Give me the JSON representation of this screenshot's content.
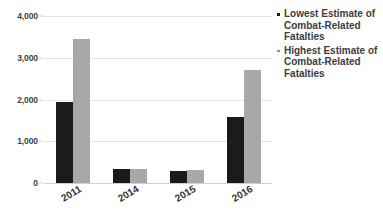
{
  "chart_data": {
    "type": "bar",
    "title": "",
    "subtitle": "",
    "xlabel": "",
    "ylabel": "",
    "categories": [
      "2011",
      "2014",
      "2015",
      "2016"
    ],
    "series": [
      {
        "name": "Lowest Estimate of Combat-Related Fatalties",
        "color": "#1b1b1b",
        "values": [
          1940,
          330,
          280,
          1580
        ]
      },
      {
        "name": "Highest Estimate of Combat-Related Fatalties",
        "color": "#a8a8a8",
        "values": [
          3450,
          330,
          320,
          2700
        ]
      }
    ],
    "ylim": [
      0,
      4000
    ],
    "yticks": [
      "0",
      "1,000",
      "2,000",
      "3,000",
      "4,000"
    ],
    "ytick_values": [
      0,
      1000,
      2000,
      3000,
      4000
    ],
    "grid": true,
    "legend_position": "right",
    "annotations": []
  },
  "legend": {
    "entries": [
      {
        "marker": "low-series-marker",
        "label": "Lowest Estimate of Combat-Related Fatalties"
      },
      {
        "marker": "high-series-marker",
        "label": "Highest Estimate of Combat-Related Fatalties"
      }
    ]
  },
  "axis": {
    "y_tick_labels": [
      "4,000",
      "3,000",
      "2,000",
      "1,000",
      "0"
    ],
    "x_tick_labels": [
      "2011",
      "2014",
      "2015",
      "2016"
    ]
  },
  "colors": {
    "low_series": "#1b1b1b",
    "high_series": "#a8a8a8",
    "gridline": "#e3e3e3",
    "baseline": "#cfcfcf",
    "text": "#3d3d3d",
    "background": "#ffffff"
  }
}
